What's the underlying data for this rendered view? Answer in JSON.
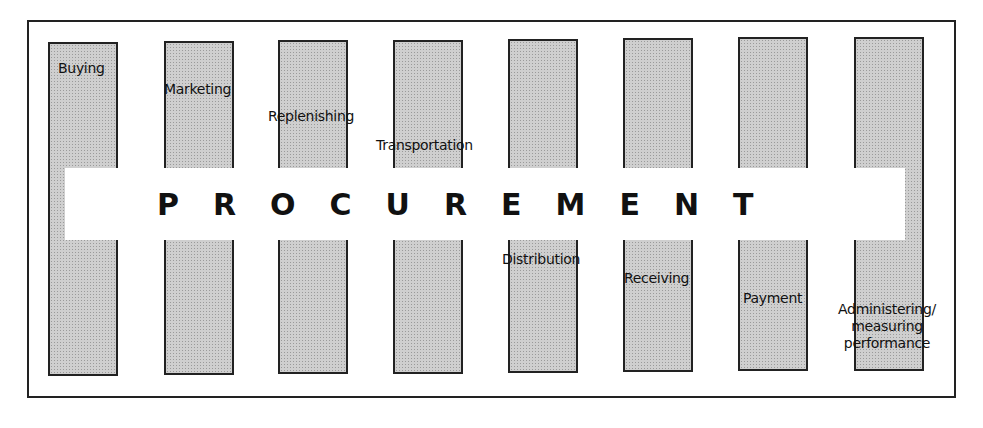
{
  "diagram": {
    "banner": {
      "title": "PROCUREMENT"
    },
    "activities": [
      {
        "label": "Buying"
      },
      {
        "label": "Marketing"
      },
      {
        "label": "Replenishing"
      },
      {
        "label": "Transportation"
      },
      {
        "label": "Distribution"
      },
      {
        "label": "Receiving"
      },
      {
        "label": "Payment"
      },
      {
        "label": "Administering/ measuring performance"
      }
    ],
    "colors": {
      "bar_fill": "#cfcfcf",
      "border": "#222222",
      "banner_bg": "#ffffff",
      "text": "#111111"
    }
  }
}
